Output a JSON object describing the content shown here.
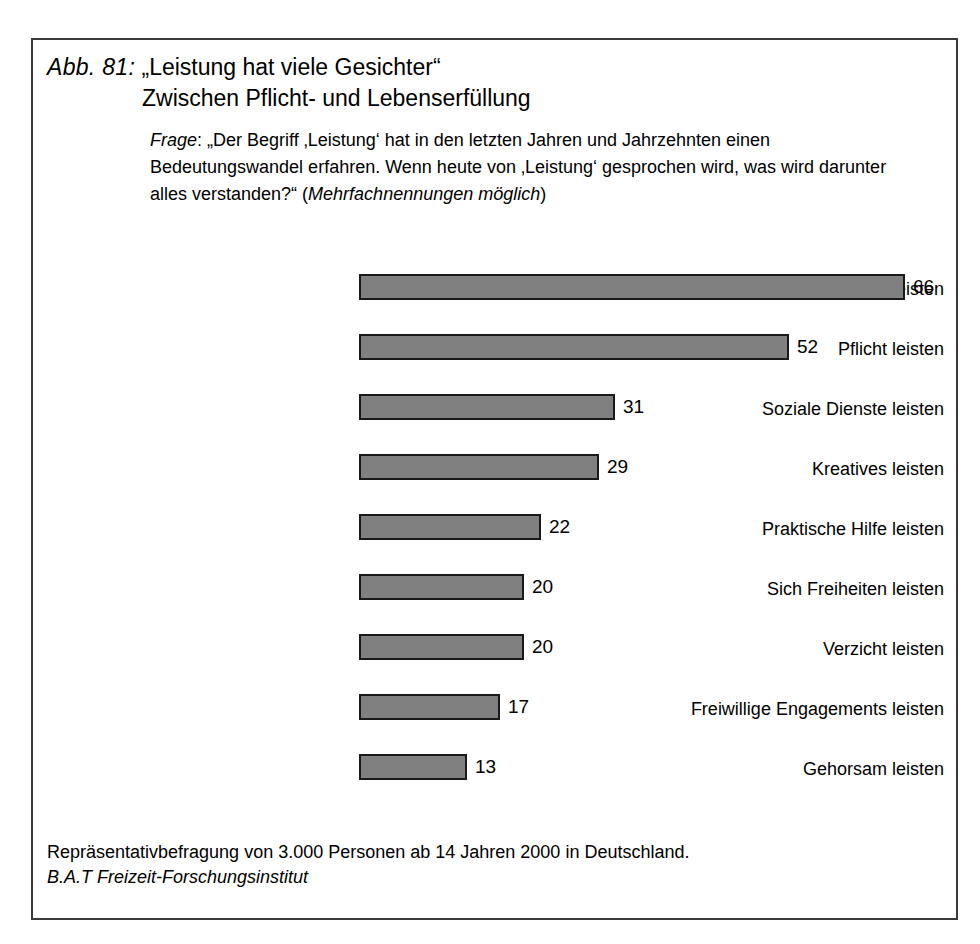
{
  "figure": {
    "number_label": "Abb. 81:",
    "title_line_1": "„Leistung hat viele Gesichter“",
    "title_line_2": "Zwischen Pflicht- und Lebenserfüllung",
    "question_label": "Frage",
    "question_separator": ": ",
    "question_text": "„Der Begriff ‚Leistung‘ hat in den letzten Jahren und Jahrzehnten einen Bedeutungswandel erfahren. Wenn heute von ‚Leistung‘ gesprochen wird, was wird darunter alles verstanden?“ ",
    "question_note_open": "(",
    "question_note": "Mehrfachnennungen möglich",
    "question_note_close": ")",
    "footer_line_1": "Repräsentativbefragung von 3.000 Personen ab 14 Jahren 2000 in Deutschland.",
    "footer_line_2": "B.A.T Freizeit-Forschungsinstitut",
    "frame_color": "#3a3a3a"
  },
  "chart_data": {
    "type": "bar",
    "orientation": "horizontal",
    "xlabel": "",
    "ylabel": "",
    "xlim": [
      0,
      66
    ],
    "grid": false,
    "legend": false,
    "bar_color": "#808080",
    "bar_border_color": "#1a1a1a",
    "value_suffix": "",
    "categories": [
      "Produktives leisten",
      "Pflicht leisten",
      "Soziale Dienste leisten",
      "Kreatives leisten",
      "Praktische Hilfe leisten",
      "Sich Freiheiten leisten",
      "Verzicht leisten",
      "Freiwillige Engagements leisten",
      "Gehorsam leisten"
    ],
    "values": [
      66,
      52,
      31,
      29,
      22,
      20,
      20,
      17,
      13
    ]
  }
}
